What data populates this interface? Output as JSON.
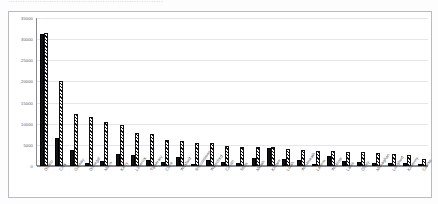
{
  "page": {
    "cut_off_text_above": "................................................................"
  },
  "chart_data": {
    "type": "bar",
    "title": "",
    "subtitle": "",
    "xlabel": "",
    "ylabel": "",
    "ylim": [
      0,
      35000
    ],
    "yticks": [
      "35000",
      "30000",
      "25000",
      "20000",
      "15000",
      "10000",
      "5000",
      "0"
    ],
    "grid": true,
    "legend_position": "none",
    "categories": [
      "Dublin",
      "Cork",
      "Galway",
      "Donegal",
      "Mayo",
      "Kerry",
      "Limerick",
      "Tipperary",
      "Clare",
      "Wexford",
      "Roscommon",
      "Waterford",
      "Cavan",
      "Sligo",
      "Meath",
      "Kildare",
      "Louth",
      "Westmeath",
      "Leitrim",
      "Wicklow",
      "Laois",
      "Offaly",
      "Monaghan",
      "Longford",
      "Kilkenny",
      "Carlow"
    ],
    "series": [
      {
        "name": "Series 1",
        "pattern": "solid-black",
        "values": [
          31200,
          6600,
          3700,
          800,
          1150,
          2900,
          2500,
          1350,
          1050,
          2200,
          550,
          1350,
          950,
          600,
          2000,
          4200,
          1600,
          1500,
          400,
          2350,
          1100,
          1050,
          700,
          750,
          800,
          300
        ]
      },
      {
        "name": "Series 2",
        "pattern": "diagonal-hatch",
        "values": [
          31400,
          20000,
          12400,
          11500,
          10500,
          9800,
          7800,
          7500,
          6100,
          5900,
          5500,
          5400,
          4700,
          4600,
          4500,
          4500,
          4100,
          3800,
          3600,
          3600,
          3300,
          3200,
          3000,
          2900,
          2700,
          1700
        ]
      }
    ]
  }
}
